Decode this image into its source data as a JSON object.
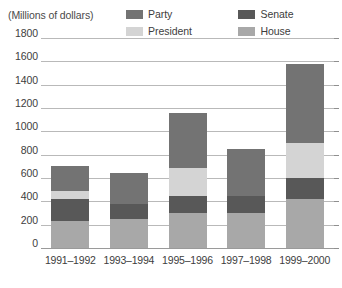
{
  "chart_data": {
    "type": "bar",
    "subtype": "stacked-bar",
    "title": "",
    "axis_caption": "(Millions of dollars)",
    "xlabel": "",
    "ylabel": "Millions of dollars",
    "ylim": [
      0,
      1800
    ],
    "ytick_step": 200,
    "ytick_labels": [
      "1800",
      "1600",
      "1400",
      "1200",
      "1000",
      "800",
      "600",
      "400",
      "200",
      "0"
    ],
    "ytick_values": [
      1800,
      1600,
      1400,
      1200,
      1000,
      800,
      600,
      400,
      200,
      0
    ],
    "grid": true,
    "grid_axis": "y",
    "legend_position": "top-right",
    "legend_order": [
      "Party",
      "Senate",
      "President",
      "House"
    ],
    "stack_order_bottom_to_top": [
      "House",
      "Senate",
      "President",
      "Party"
    ],
    "categories": [
      "1991–1992",
      "1993–1994",
      "1995–1996",
      "1997–1998",
      "1999–2000"
    ],
    "series": [
      {
        "name": "House",
        "color": "#a8a8a8",
        "values": [
          230,
          250,
          300,
          300,
          420
        ]
      },
      {
        "name": "Senate",
        "color": "#585858",
        "values": [
          190,
          130,
          150,
          150,
          180
        ]
      },
      {
        "name": "President",
        "color": "#d4d4d4",
        "values": [
          70,
          0,
          240,
          0,
          300
        ]
      },
      {
        "name": "Party",
        "color": "#737373",
        "values": [
          210,
          260,
          470,
          400,
          680
        ]
      }
    ],
    "totals": [
      700,
      640,
      1160,
      850,
      1580
    ]
  },
  "legend": {
    "entries": [
      {
        "label": "Party",
        "color": "#737373"
      },
      {
        "label": "Senate",
        "color": "#585858"
      },
      {
        "label": "President",
        "color": "#d4d4d4"
      },
      {
        "label": "House",
        "color": "#a8a8a8"
      }
    ]
  },
  "colors": {
    "party": "#737373",
    "senate": "#585858",
    "president": "#d4d4d4",
    "house": "#a8a8a8",
    "gridline": "#b9b9b9",
    "text": "#3d3d3d",
    "background": "#ffffff"
  }
}
